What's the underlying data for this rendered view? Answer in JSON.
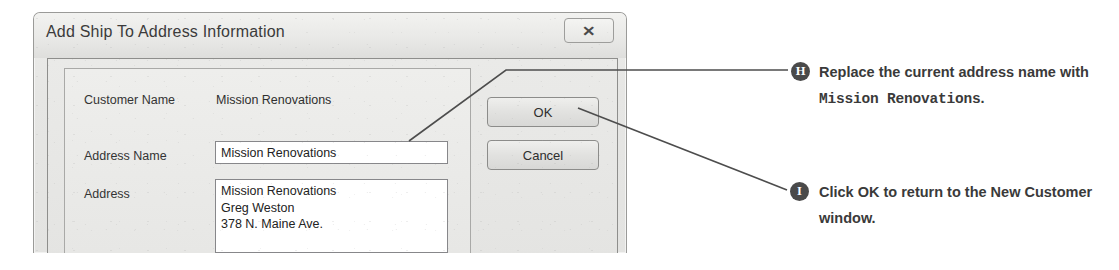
{
  "dialog": {
    "title": "Add Ship To Address Information",
    "close_icon": "close-x-icon",
    "close_glyph": "✕",
    "fields": [
      {
        "label": "Customer Name",
        "value": "Mission Renovations",
        "type": "static"
      },
      {
        "label": "Address Name",
        "value": "Mission Renovations",
        "type": "text"
      },
      {
        "label": "Address",
        "value": "Mission Renovations\nGreg Weston\n378 N. Maine Ave.",
        "type": "textarea"
      }
    ],
    "buttons": {
      "ok": "OK",
      "cancel": "Cancel"
    }
  },
  "annotations": [
    {
      "badge": "H",
      "text_before": "Replace the current address name with ",
      "text_mono": "Mission Renovations",
      "text_after": "."
    },
    {
      "badge": "I",
      "text_before": "Click OK to return to the New Customer window.",
      "text_mono": "",
      "text_after": ""
    }
  ],
  "colors": {
    "badge_fill": "#4a4a4a",
    "text": "#3a3a3a",
    "leader_line": "#4d4d4d",
    "dialog_face": "#e7e7e5"
  }
}
